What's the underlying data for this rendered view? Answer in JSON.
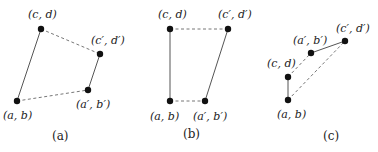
{
  "panels": [
    {
      "caption": "(a)",
      "points": {
        "ab": {
          "label": "(a, b)",
          "x": 17,
          "y": 101
        },
        "cd": {
          "label": "(c, d)",
          "x": 41,
          "y": 29
        },
        "cpdp": {
          "label": "(c′, d′)",
          "x": 100,
          "y": 54
        },
        "apbp": {
          "label": "(a′, b′)",
          "x": 88,
          "y": 90
        }
      },
      "solid_edges": [
        [
          "ab",
          "cd"
        ],
        [
          "apbp",
          "cpdp"
        ]
      ],
      "dashed_edges": [
        [
          "cd",
          "cpdp"
        ],
        [
          "ab",
          "apbp"
        ]
      ]
    },
    {
      "caption": "(b)",
      "points": {
        "ab": {
          "label": "(a, b)",
          "x": 170,
          "y": 101
        },
        "cd": {
          "label": "(c, d)",
          "x": 170,
          "y": 29
        },
        "cpdp": {
          "label": "(c′, d′)",
          "x": 228,
          "y": 29
        },
        "apbp": {
          "label": "(a′, b′)",
          "x": 205,
          "y": 101
        }
      },
      "solid_edges": [
        [
          "ab",
          "cd"
        ],
        [
          "apbp",
          "cpdp"
        ]
      ],
      "dashed_edges": [
        [
          "cd",
          "cpdp"
        ],
        [
          "ab",
          "apbp"
        ]
      ]
    },
    {
      "caption": "(c)",
      "points": {
        "ab": {
          "label": "(a, b)",
          "x": 288,
          "y": 100
        },
        "cd": {
          "label": "(c, d)",
          "x": 288,
          "y": 77
        },
        "cpdp": {
          "label": "(c′, d′)",
          "x": 345,
          "y": 41
        },
        "apbp": {
          "label": "(a′, b′)",
          "x": 311,
          "y": 53
        }
      },
      "solid_edges": [
        [
          "ab",
          "cd"
        ],
        [
          "apbp",
          "cpdp"
        ]
      ],
      "dashed_edges": [
        [
          "cd",
          "apbp"
        ],
        [
          "ab",
          "cpdp"
        ]
      ]
    }
  ]
}
